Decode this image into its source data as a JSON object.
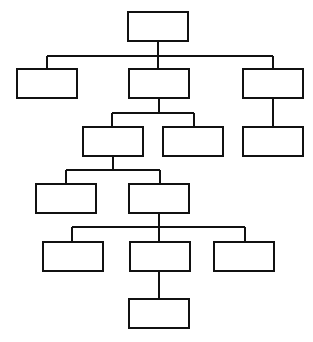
{
  "diagram": {
    "type": "org-chart",
    "stroke_color": "#111111",
    "fill_color": "#ffffff",
    "background": "#ffffff",
    "node_size": {
      "width": 60,
      "height": 29
    },
    "nodes": [
      {
        "id": "root",
        "label": "",
        "x": 128,
        "y": 12
      },
      {
        "id": "l1-a",
        "label": "",
        "x": 17,
        "y": 69
      },
      {
        "id": "l1-b",
        "label": "",
        "x": 129,
        "y": 69
      },
      {
        "id": "l1-c",
        "label": "",
        "x": 243,
        "y": 69
      },
      {
        "id": "l2-a",
        "label": "",
        "x": 83,
        "y": 127
      },
      {
        "id": "l2-b",
        "label": "",
        "x": 163,
        "y": 127
      },
      {
        "id": "l2-c",
        "label": "",
        "x": 243,
        "y": 127
      },
      {
        "id": "l3-a",
        "label": "",
        "x": 36,
        "y": 184
      },
      {
        "id": "l3-b",
        "label": "",
        "x": 129,
        "y": 184
      },
      {
        "id": "l4-a",
        "label": "",
        "x": 43,
        "y": 242
      },
      {
        "id": "l4-b",
        "label": "",
        "x": 130,
        "y": 242
      },
      {
        "id": "l4-c",
        "label": "",
        "x": 214,
        "y": 242
      },
      {
        "id": "l5-a",
        "label": "",
        "x": 129,
        "y": 299
      }
    ],
    "edges": [
      {
        "id": "root-children",
        "points": "158,41 158,56",
        "bus": "47,56 273,56",
        "drops": [
          "47,56 47,69",
          "158,56 158,69",
          "273,56 273,69"
        ]
      },
      {
        "id": "l1b-children",
        "points": "159,98 159,113",
        "bus": "112,113 194,113",
        "drops": [
          "112,113 112,127",
          "194,113 194,127"
        ]
      },
      {
        "id": "l1c-children",
        "points": "273,98 273,127",
        "bus": "",
        "drops": []
      },
      {
        "id": "l2a-children",
        "points": "113,156 113,170",
        "bus": "66,170 160,170",
        "drops": [
          "66,170 66,184",
          "160,170 160,184"
        ]
      },
      {
        "id": "l3b-children",
        "points": "159,213 159,227",
        "bus": "72,227 245,227",
        "drops": [
          "72,227 72,242",
          "159,227 159,242",
          "245,227 245,242"
        ]
      },
      {
        "id": "l4b-children",
        "points": "159,271 159,299",
        "bus": "",
        "drops": []
      }
    ]
  }
}
